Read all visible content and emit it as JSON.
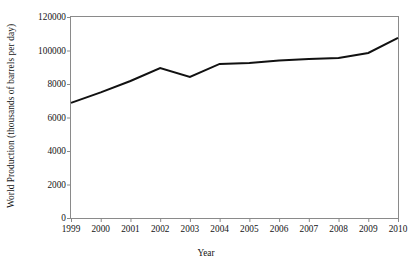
{
  "chart_data": {
    "type": "line",
    "title": "",
    "xlabel": "Year",
    "ylabel": "World Production (thousands of barrels per day)",
    "x": [
      1999,
      2000,
      2001,
      2002,
      2003,
      2004,
      2005,
      2006,
      2007,
      2008,
      2009,
      2010
    ],
    "values": [
      68700,
      75000,
      81800,
      89500,
      84200,
      92000,
      92500,
      94000,
      95000,
      95500,
      98500,
      107500
    ],
    "series": [
      {
        "name": "World Production",
        "values": [
          68700,
          75000,
          81800,
          89500,
          84200,
          92000,
          92500,
          94000,
          95000,
          95500,
          98500,
          107500
        ]
      }
    ],
    "xtick_labels": [
      "1999",
      "2000",
      "2001",
      "2002",
      "2003",
      "2004",
      "2005",
      "2006",
      "2007",
      "2008",
      "2009",
      "2010"
    ],
    "ytick_values": [
      0,
      2000,
      4000,
      6000,
      8000,
      100000,
      120000
    ],
    "ytick_labels": [
      "0",
      "2000",
      "4000",
      "6000",
      "8000",
      "100000",
      "120000"
    ],
    "ylim": [
      0,
      120000
    ],
    "xlim": [
      1999,
      2010
    ],
    "grid": false,
    "legend": false,
    "legend_position": "none",
    "line_color": "#111111",
    "frame_color": "#8a8a8a",
    "background_color": "#ffffff"
  }
}
